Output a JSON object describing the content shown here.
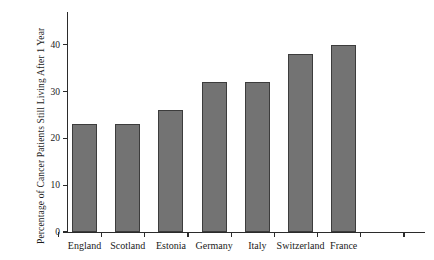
{
  "chart_data": {
    "type": "bar",
    "title": "",
    "subtitle": "",
    "xlabel": "",
    "ylabel": "Percentage of Cancer Patients Still Living After 1 Year",
    "categories": [
      "England",
      "Scotland",
      "Estonia",
      "Germany",
      "Italy",
      "Switzerland",
      "France"
    ],
    "values": [
      23,
      23,
      26,
      32,
      32,
      38,
      40
    ],
    "ylim": [
      0,
      47
    ],
    "ytick_labels": [
      "0",
      "10",
      "20",
      "30",
      "40"
    ],
    "ytick_values": [
      0,
      10,
      20,
      30,
      40
    ],
    "grid": false,
    "legend": null,
    "legend_position": "none",
    "annotations": [],
    "bar_color": "#737373",
    "bar_edge_color": "#3c3c3c",
    "axis_color": "#2b2b2b",
    "background_color": "#ffffff"
  }
}
